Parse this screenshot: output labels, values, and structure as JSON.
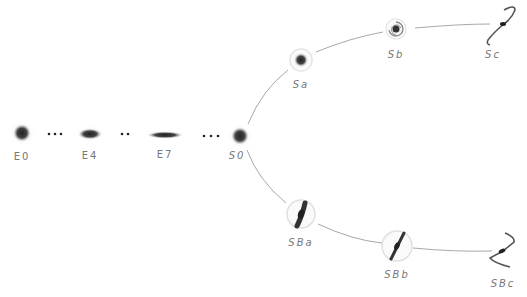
{
  "diagram": {
    "elliptical": [
      {
        "label": "E0",
        "x": 22,
        "y": 133,
        "lx": 22,
        "ly": 151
      },
      {
        "label": "E4",
        "x": 90,
        "y": 134,
        "lx": 90,
        "ly": 150
      },
      {
        "label": "E7",
        "x": 165,
        "y": 135,
        "lx": 165,
        "ly": 149
      }
    ],
    "separators": [
      "•••",
      "••",
      "•••"
    ],
    "lenticular": {
      "label": "S0",
      "x": 240,
      "y": 136,
      "lx": 237,
      "ly": 149
    },
    "spiral": [
      {
        "label": "Sa",
        "x": 301,
        "y": 60,
        "lx": 301,
        "ly": 80
      },
      {
        "label": "Sb",
        "x": 396,
        "y": 29,
        "lx": 396,
        "ly": 50
      },
      {
        "label": "Sc",
        "x": 502,
        "y": 24,
        "lx": 493,
        "ly": 50
      }
    ],
    "barred_spiral": [
      {
        "label": "SBa",
        "x": 301,
        "y": 214,
        "lx": 301,
        "ly": 237
      },
      {
        "label": "SBb",
        "x": 397,
        "y": 246,
        "lx": 397,
        "ly": 270
      },
      {
        "label": "SBc",
        "x": 500,
        "y": 251,
        "lx": 503,
        "ly": 278
      }
    ],
    "colors": {
      "line": "#a0a0a0",
      "galaxy": "#333333",
      "label": "#777777"
    }
  }
}
